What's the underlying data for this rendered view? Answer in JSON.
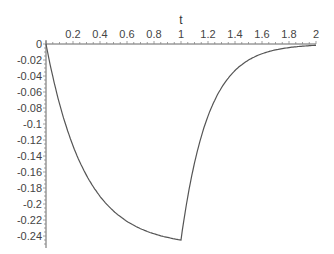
{
  "chart_data": {
    "type": "line",
    "title": "",
    "xlabel": "t",
    "ylabel": "",
    "xlim": [
      0,
      2
    ],
    "ylim": [
      -0.25,
      0
    ],
    "grid": false,
    "legend": null,
    "x_ticks": [
      "0.2",
      "0.4",
      "0.6",
      "0.8",
      "1",
      "1.2",
      "1.4",
      "1.6",
      "1.8",
      "2"
    ],
    "y_ticks": [
      "0",
      "-0.02",
      "-0.04",
      "-0.06",
      "-0.08",
      "-0.1",
      "-0.12",
      "-0.14",
      "-0.16",
      "-0.18",
      "-0.2",
      "-0.22",
      "-0.24"
    ],
    "series": [
      {
        "name": "curve",
        "x": [
          0,
          0.05,
          0.1,
          0.15,
          0.2,
          0.3,
          0.4,
          0.5,
          0.6,
          0.7,
          0.8,
          0.9,
          1.0,
          1.05,
          1.1,
          1.15,
          1.2,
          1.3,
          1.4,
          1.5,
          1.6,
          1.7,
          1.8,
          1.9,
          2.0
        ],
        "y": [
          0,
          -0.048,
          -0.087,
          -0.118,
          -0.143,
          -0.18,
          -0.204,
          -0.22,
          -0.23,
          -0.237,
          -0.241,
          -0.243,
          -0.245,
          -0.19,
          -0.148,
          -0.115,
          -0.089,
          -0.054,
          -0.033,
          -0.02,
          -0.012,
          -0.007,
          -0.004,
          -0.003,
          -0.002
        ]
      }
    ]
  }
}
